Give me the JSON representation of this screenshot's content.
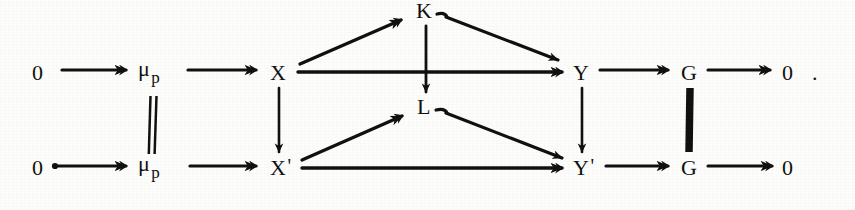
{
  "document": {
    "kind": "commutative-diagram",
    "background_color": "#fdfdfc",
    "ink_color": "#111111",
    "width": 855,
    "height": 210
  },
  "nodes": {
    "zero_top_left": {
      "text": "0",
      "x": 38,
      "y": 75
    },
    "mu_p_top": {
      "base": "μ",
      "sub": "p",
      "x": 143,
      "y": 70
    },
    "x_top": {
      "text": "X",
      "x": 272,
      "y": 75
    },
    "k_node": {
      "text": "K",
      "x": 419,
      "y": 12
    },
    "l_node": {
      "text": "L",
      "x": 419,
      "y": 108
    },
    "y_top": {
      "text": "Y",
      "x": 575,
      "y": 75
    },
    "g_top": {
      "text": "G",
      "x": 683,
      "y": 75
    },
    "zero_top_right": {
      "text": "0",
      "x": 786,
      "y": 75
    },
    "period": {
      "text": ".",
      "x": 814,
      "y": 75
    },
    "zero_bottom_left": {
      "text": "0",
      "x": 38,
      "y": 170
    },
    "mu_p_bottom": {
      "base": "μ",
      "sub": "p",
      "x": 143,
      "y": 165
    },
    "x_prime": {
      "base": "X",
      "prime": "'",
      "x": 272,
      "y": 170
    },
    "y_prime": {
      "base": "Y",
      "prime": "'",
      "x": 575,
      "y": 170
    },
    "g_bottom": {
      "text": "G",
      "x": 683,
      "y": 170
    },
    "zero_bottom_right": {
      "text": "0",
      "x": 786,
      "y": 170
    }
  },
  "rows": {
    "top_sequence": [
      "0",
      "μ p",
      "X",
      "Y",
      "G",
      "0",
      "."
    ],
    "bottom_sequence": [
      "0",
      "μ p",
      "X'",
      "Y'",
      "G",
      "0"
    ]
  },
  "edges": [
    {
      "name": "zero-to-mu-top",
      "kind": "horizontal-arrow",
      "from": "zero_top_left",
      "to": "mu_p_top"
    },
    {
      "name": "mu-to-x-top",
      "kind": "horizontal-arrow",
      "from": "mu_p_top",
      "to": "x_top"
    },
    {
      "name": "x-to-y-top",
      "kind": "horizontal-arrow",
      "from": "x_top",
      "to": "y_top"
    },
    {
      "name": "y-to-g-top",
      "kind": "horizontal-arrow",
      "from": "y_top",
      "to": "g_top"
    },
    {
      "name": "g-to-zero-top",
      "kind": "horizontal-arrow",
      "from": "g_top",
      "to": "zero_top_right"
    },
    {
      "name": "zero-to-mu-bottom",
      "kind": "horizontal-arrow",
      "from": "zero_bottom_left",
      "to": "mu_p_bottom"
    },
    {
      "name": "mu-to-xprime",
      "kind": "horizontal-arrow",
      "from": "mu_p_bottom",
      "to": "x_prime"
    },
    {
      "name": "xprime-to-yprime",
      "kind": "horizontal-arrow",
      "from": "x_prime",
      "to": "y_prime"
    },
    {
      "name": "yprime-to-g-bottom",
      "kind": "horizontal-arrow",
      "from": "y_prime",
      "to": "g_bottom"
    },
    {
      "name": "g-to-zero-bottom",
      "kind": "horizontal-arrow",
      "from": "g_bottom",
      "to": "zero_bottom_right"
    },
    {
      "name": "x-to-xprime",
      "kind": "vertical-arrow",
      "from": "x_top",
      "to": "x_prime"
    },
    {
      "name": "y-to-yprime",
      "kind": "vertical-arrow",
      "from": "y_top",
      "to": "y_prime"
    },
    {
      "name": "k-to-l",
      "kind": "vertical-arrow",
      "from": "k_node",
      "to": "l_node"
    },
    {
      "name": "mu-equality-bar",
      "kind": "double-bar",
      "from": "mu_p_top",
      "to": "mu_p_bottom"
    },
    {
      "name": "g-equality-bar",
      "kind": "thick-bar",
      "from": "g_top",
      "to": "g_bottom"
    },
    {
      "name": "x-to-k",
      "kind": "diagonal-arrow-up",
      "from": "x_top",
      "to": "k_node"
    },
    {
      "name": "k-to-y",
      "kind": "diagonal-arrow-down",
      "from": "k_node",
      "to": "y_top"
    },
    {
      "name": "xprime-to-l",
      "kind": "diagonal-arrow-up",
      "from": "x_prime",
      "to": "l_node"
    },
    {
      "name": "l-to-yprime",
      "kind": "diagonal-arrow-down",
      "from": "l_node",
      "to": "y_prime"
    }
  ]
}
